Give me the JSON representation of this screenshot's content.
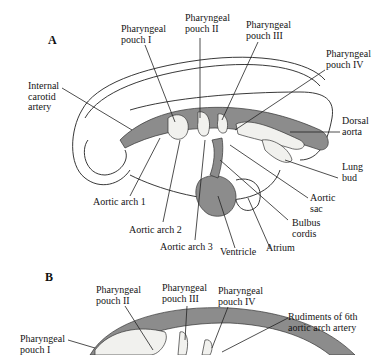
{
  "panels": [
    {
      "id": "A",
      "label": "A",
      "labels": {
        "pharyngeal_pouch_1": "Pharyngeal\npouch I",
        "pharyngeal_pouch_2": "Pharyngeal\npouch II",
        "pharyngeal_pouch_3": "Pharyngeal\npouch III",
        "pharyngeal_pouch_4": "Pharyngeal\npouch IV",
        "internal_carotid_artery": "Internal\ncarotid\nartery",
        "dorsal_aorta": "Dorsal\naorta",
        "lung_bud": "Lung\nbud",
        "aortic_sac": "Aortic\nsac",
        "bulbus_cordis": "Bulbus\ncordis",
        "atrium": "Atrium",
        "ventricle": "Ventricle",
        "aortic_arch_1": "Aortic arch 1",
        "aortic_arch_2": "Aortic arch 2",
        "aortic_arch_3": "Aortic arch 3"
      }
    },
    {
      "id": "B",
      "label": "B",
      "labels": {
        "pharyngeal_pouch_1": "Pharyngeal\npouch I",
        "pharyngeal_pouch_2": "Pharyngeal\npouch II",
        "pharyngeal_pouch_3": "Pharyngeal\npouch III",
        "pharyngeal_pouch_4": "Pharyngeal\npouch IV",
        "rudiments_6th_arch": "Rudiments of 6th\naortic arch artery"
      }
    }
  ],
  "colors": {
    "vessel_gray": "#8c8c8c",
    "pouch_fill": "#f1f1ee",
    "line": "#222222"
  }
}
